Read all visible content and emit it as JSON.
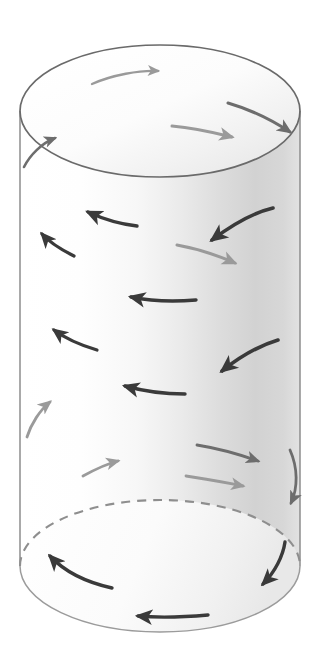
{
  "figure": {
    "type": "technical-diagram",
    "canvas": {
      "width": 319,
      "height": 668,
      "background": "#ffffff"
    }
  },
  "colors": {
    "outline": "#6a6a6a",
    "outline_top": "#707070",
    "hidden_edge": "#8e8e8e",
    "arrow_dark": "#3a3a3a",
    "arrow_mid": "#6d6d6d",
    "arrow_light": "#9a9a9a",
    "arrow_faint": "#b4b4b4",
    "shade_light": "#fdfdfd",
    "shade_mid": "#ededed",
    "shade_dark": "#c9c9c9",
    "top_face_light": "#ffffff",
    "top_face_shade": "#ececec"
  },
  "cylinder": {
    "center_x": 160,
    "left_x": 20,
    "right_x": 301,
    "radius_x": 140,
    "radius_y": 66,
    "top_center_y": 111,
    "bottom_center_y": 566,
    "top_apex_y": 45,
    "bottom_apex_y": 632,
    "body_top_y": 111,
    "body_bottom_y": 566,
    "hidden_edge_dash": "9 7"
  },
  "arrows": [
    {
      "id": "top-face-arrow-1",
      "name": "top-face-arrow-near",
      "surface": "top-face",
      "shade": "arrow_light",
      "width": 2.4,
      "head": 7.5,
      "path": "M 92 84 C 112 75, 140 70, 158 71",
      "direction": "clockwise-right"
    },
    {
      "id": "top-face-arrow-2",
      "name": "top-face-arrow-far-right",
      "surface": "top-face",
      "shade": "arrow_mid",
      "width": 3.0,
      "head": 9,
      "path": "M 228 103 C 252 110, 275 122, 290 132",
      "direction": "clockwise-right-down"
    },
    {
      "id": "top-face-arrow-3",
      "name": "top-face-arrow-middle",
      "surface": "top-face",
      "shade": "arrow_light",
      "width": 3.0,
      "head": 9,
      "path": "M 172 126 C 196 128, 216 133, 232 137",
      "direction": "clockwise-right"
    },
    {
      "id": "rim-arrow-left",
      "name": "left-rim-wrap-arrow",
      "surface": "left-wrap",
      "shade": "arrow_mid",
      "width": 2.6,
      "head": 8.5,
      "path": "M 24 167 C 30 155, 42 143, 55 138",
      "direction": "up-right-over-rim"
    },
    {
      "id": "body-arrow-1",
      "name": "body-arrow-row1-right-dark",
      "surface": "front-body",
      "shade": "arrow_dark",
      "width": 3.6,
      "head": 11,
      "path": "M 273 208 C 252 213, 228 228, 212 240",
      "direction": "counterclockwise-left-down"
    },
    {
      "id": "body-arrow-2",
      "name": "body-arrow-row1-center-dark",
      "surface": "front-body",
      "shade": "arrow_dark",
      "width": 3.4,
      "head": 11,
      "path": "M 137 226 C 119 224, 101 218, 88 212",
      "direction": "counterclockwise-left"
    },
    {
      "id": "body-arrow-3",
      "name": "body-arrow-row1-left-dark",
      "surface": "front-body",
      "shade": "arrow_dark",
      "width": 3.2,
      "head": 10,
      "path": "M 74 256 C 62 250, 50 243, 42 234",
      "direction": "counterclockwise-left-up"
    },
    {
      "id": "body-arrow-4",
      "name": "body-arrow-row2-right-light",
      "surface": "front-body",
      "shade": "arrow_light",
      "width": 3.0,
      "head": 9,
      "path": "M 177 245 C 199 249, 219 256, 235 263",
      "direction": "clockwise-right-down"
    },
    {
      "id": "body-arrow-5",
      "name": "body-arrow-row2-center-dark",
      "surface": "front-body",
      "shade": "arrow_dark",
      "width": 3.4,
      "head": 11,
      "path": "M 196 300 C 173 302, 150 301, 131 297",
      "direction": "counterclockwise-left"
    },
    {
      "id": "body-arrow-6",
      "name": "body-arrow-row3-left-dark",
      "surface": "front-body",
      "shade": "arrow_dark",
      "width": 3.2,
      "head": 10,
      "path": "M 97 350 C 80 345, 66 339, 54 330",
      "direction": "counterclockwise-left-up"
    },
    {
      "id": "body-arrow-7",
      "name": "body-arrow-row3-right-dark",
      "surface": "front-body",
      "shade": "arrow_dark",
      "width": 3.6,
      "head": 11,
      "path": "M 278 340 C 258 346, 237 359, 222 371",
      "direction": "counterclockwise-left-down"
    },
    {
      "id": "body-arrow-8",
      "name": "body-arrow-row4-center-dark",
      "surface": "front-body",
      "shade": "arrow_dark",
      "width": 3.4,
      "head": 11,
      "path": "M 185 394 C 164 394, 143 391, 125 386"
    },
    {
      "id": "body-arrow-9",
      "name": "body-arrow-row4-left-light",
      "surface": "front-body",
      "shade": "arrow_light",
      "width": 2.8,
      "head": 9,
      "path": "M 27 437 C 31 424, 40 410, 50 402",
      "direction": "clockwise-up"
    },
    {
      "id": "body-arrow-10",
      "name": "body-arrow-row4-right-mid",
      "surface": "front-body",
      "shade": "arrow_mid",
      "width": 2.8,
      "head": 9,
      "path": "M 197 445 C 222 449, 244 456, 258 461",
      "direction": "clockwise-right-down"
    },
    {
      "id": "body-arrow-11",
      "name": "body-arrow-row5-left-light",
      "surface": "front-body",
      "shade": "arrow_light",
      "width": 2.8,
      "head": 9,
      "path": "M 83 476 C 94 470, 106 464, 118 461",
      "direction": "clockwise-right-up"
    },
    {
      "id": "body-arrow-12",
      "name": "body-arrow-row5-center-light",
      "surface": "front-body",
      "shade": "arrow_light",
      "width": 2.8,
      "head": 9,
      "path": "M 186 476 C 208 479, 227 483, 243 486",
      "direction": "clockwise-right"
    },
    {
      "id": "body-arrow-13",
      "name": "right-edge-wrap-arrow",
      "surface": "right-wrap",
      "shade": "arrow_mid",
      "width": 2.8,
      "head": 9,
      "path": "M 290 450 C 298 468, 298 488, 291 503",
      "direction": "wrap-around-right-down"
    },
    {
      "id": "bottom-arrow-1",
      "name": "bottom-face-arrow-left-dark",
      "surface": "bottom-face",
      "shade": "arrow_dark",
      "width": 3.4,
      "head": 11,
      "path": "M 112 588 C 85 582, 63 570, 50 556",
      "direction": "counterclockwise-left-up"
    },
    {
      "id": "bottom-arrow-2",
      "name": "bottom-face-arrow-right-dark",
      "surface": "bottom-face",
      "shade": "arrow_dark",
      "width": 3.4,
      "head": 11,
      "path": "M 285 542 C 283 556, 275 572, 263 584",
      "direction": "counterclockwise-down-left"
    },
    {
      "id": "bottom-arrow-3",
      "name": "bottom-face-arrow-center-dark",
      "surface": "bottom-face",
      "shade": "arrow_dark",
      "width": 3.4,
      "head": 11,
      "path": "M 208 615 C 185 617, 160 618, 138 616",
      "direction": "counterclockwise-left"
    }
  ]
}
